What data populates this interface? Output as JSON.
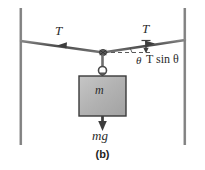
{
  "figure": {
    "caption": "(b)",
    "background_color": "#ffffff",
    "line_color": "#4a4a4a",
    "block_fill": "#b4b4b4",
    "block_stroke": "#3a3a3a"
  },
  "labels": {
    "tension_left": "T",
    "tension_right": "T",
    "angle": "θ",
    "vertical_component_prefix": "T",
    "vertical_component_rest": " sin ",
    "vertical_component_angle": "θ",
    "vertical_component_full": "T sin θ",
    "mass": "m",
    "weight": "mg"
  },
  "elements": {
    "left_post": "vertical-post-left",
    "right_post": "vertical-post-right",
    "cable_left_segment": "cable-left",
    "cable_right_segment": "cable-right",
    "knot": "cable-knot",
    "rope": "hanging-rope",
    "ring": "rope-ring",
    "block": "mass-block",
    "weight_arrow": "weight-force-arrow",
    "tension_arrow_left": "tension-arrow-left",
    "tension_arrow_right": "tension-arrow-right",
    "component_arrow": "tension-vertical-component-arrow",
    "dashed_horizontal": "horizontal-reference-dashed-line",
    "angle_arc": "angle-arc"
  }
}
